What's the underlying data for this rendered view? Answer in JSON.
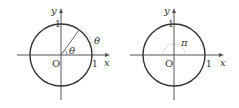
{
  "figures": [
    {
      "id": "left",
      "labels": {
        "y_axis": "y",
        "x_axis": "x",
        "origin": "O",
        "y_tick": "1",
        "x_tick": "1",
        "arc_angle": "θ",
        "central_angle": "θ"
      }
    },
    {
      "id": "right",
      "labels": {
        "y_axis": "y",
        "x_axis": "x",
        "origin": "O",
        "y_tick": "1",
        "x_tick": "1",
        "central_angle": "π"
      }
    }
  ]
}
